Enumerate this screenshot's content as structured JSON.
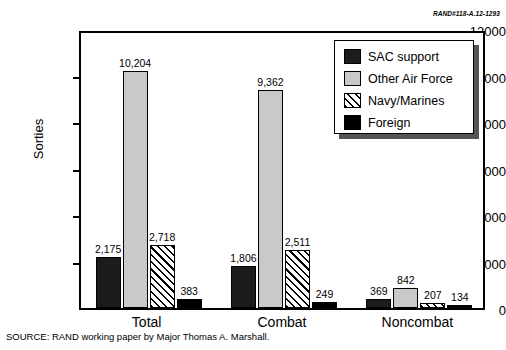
{
  "header": {
    "rand_code": "RAND#118-A.12-1293"
  },
  "source": {
    "text": "SOURCE:  RAND working paper by Major Thomas A. Marshall."
  },
  "legend": {
    "position": "top-right",
    "items": [
      {
        "label": "SAC support",
        "swatch": "dark-square-icon",
        "style": "sac"
      },
      {
        "label": "Other Air Force",
        "swatch": "light-square-icon",
        "style": "otheraf"
      },
      {
        "label": "Navy/Marines",
        "swatch": "hatched-square-icon",
        "style": "navy"
      },
      {
        "label": "Foreign",
        "swatch": "black-square-icon",
        "style": "foreign"
      }
    ]
  },
  "chart_data": {
    "type": "bar",
    "title": "",
    "subtitle": "",
    "xlabel": "",
    "ylabel": "Sorties",
    "categories": [
      "Total",
      "Combat",
      "Noncombat"
    ],
    "series": [
      {
        "name": "SAC support",
        "values": [
          2175,
          1806,
          369
        ],
        "labels": [
          "2,175",
          "1,806",
          "369"
        ]
      },
      {
        "name": "Other Air Force",
        "values": [
          10204,
          9362,
          842
        ],
        "labels": [
          "10,204",
          "9,362",
          "842"
        ]
      },
      {
        "name": "Navy/Marines",
        "values": [
          2718,
          2511,
          207
        ],
        "labels": [
          "2,718",
          "2,511",
          "207"
        ]
      },
      {
        "name": "Foreign",
        "values": [
          383,
          249,
          134
        ],
        "labels": [
          "383",
          "249",
          "134"
        ]
      }
    ],
    "ylim": [
      0,
      12000
    ],
    "yticks": [
      0,
      2000,
      4000,
      6000,
      8000,
      10000,
      12000
    ],
    "ytick_labels": [
      "0",
      "2000",
      "4000",
      "6000",
      "8000",
      "10000",
      "12000"
    ],
    "grid": false,
    "legend_position": "upper right"
  }
}
